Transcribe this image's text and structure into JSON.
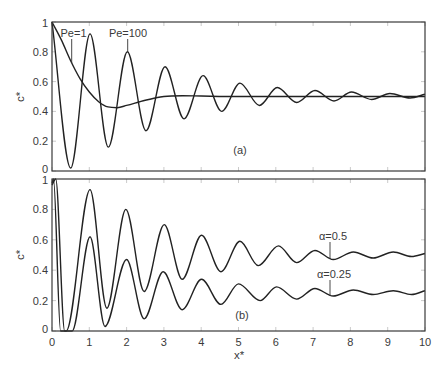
{
  "figure": {
    "x_axis_label": "x*",
    "panel_a": {
      "label": "(a)",
      "y_axis_label": "c*",
      "annotation_pe1": "Pe=1",
      "annotation_pe100": "Pe=100"
    },
    "panel_b": {
      "label": "(b)",
      "y_axis_label": "c*",
      "annotation_alpha05": "α=0.5",
      "annotation_alpha025": "α=0.25"
    },
    "colors": {
      "curve": "#222222",
      "axis": "#3a3a3a",
      "tick": "#bdbdbd"
    }
  },
  "chart_data": [
    {
      "type": "line",
      "panel": "(a)",
      "title": "",
      "xlabel": "",
      "ylabel": "c*",
      "xlim": [
        0,
        10
      ],
      "ylim": [
        0,
        1
      ],
      "xticks": [
        0,
        1,
        2,
        3,
        4,
        5,
        6,
        7,
        8,
        9,
        10
      ],
      "xtick_labels": [],
      "yticks": [
        0,
        0.2,
        0.4,
        0.6,
        0.8,
        1
      ],
      "ytick_labels": [
        "0",
        "0.2",
        "0.4",
        "0.6",
        "0.8",
        "1"
      ],
      "grid": false,
      "legend": "none (curves labelled by annotations)",
      "series": [
        {
          "name": "Pe=1",
          "x": [
            0,
            0.25,
            0.5,
            0.75,
            1.0,
            1.25,
            1.5,
            1.75,
            2.0,
            2.5,
            3.0,
            3.5,
            4.0,
            5.0,
            6.0,
            7.0,
            8.0,
            9.0,
            10.0
          ],
          "y": [
            1.0,
            0.88,
            0.74,
            0.62,
            0.53,
            0.465,
            0.43,
            0.425,
            0.44,
            0.475,
            0.5,
            0.505,
            0.503,
            0.5,
            0.5,
            0.5,
            0.5,
            0.5,
            0.5
          ]
        },
        {
          "name": "Pe=100",
          "x": [
            0,
            0.5,
            1.02,
            1.51,
            2.02,
            2.52,
            3.03,
            3.54,
            4.05,
            4.55,
            5.04,
            5.56,
            6.04,
            6.56,
            7.05,
            7.56,
            8.03,
            8.57,
            9.06,
            9.6,
            10.0
          ],
          "y": [
            1.0,
            0.02,
            0.92,
            0.16,
            0.8,
            0.27,
            0.7,
            0.35,
            0.64,
            0.4,
            0.59,
            0.44,
            0.56,
            0.46,
            0.54,
            0.47,
            0.53,
            0.48,
            0.52,
            0.49,
            0.515
          ]
        }
      ],
      "annotations": [
        {
          "text": "Pe=1",
          "points_to": [
            0.55,
            0.72
          ]
        },
        {
          "text": "Pe=100",
          "points_to": [
            2.02,
            0.8
          ]
        },
        {
          "text": "(a)",
          "position": [
            5.0,
            0.14
          ]
        }
      ]
    },
    {
      "type": "line",
      "panel": "(b)",
      "title": "",
      "xlabel": "x*",
      "ylabel": "c*",
      "xlim": [
        0,
        10
      ],
      "ylim": [
        0,
        1
      ],
      "xticks": [
        0,
        1,
        2,
        3,
        4,
        5,
        6,
        7,
        8,
        9,
        10
      ],
      "xtick_labels": [
        "0",
        "1",
        "2",
        "3",
        "4",
        "5",
        "6",
        "7",
        "8",
        "9",
        "10"
      ],
      "yticks": [
        0,
        0.2,
        0.4,
        0.6,
        0.8,
        1
      ],
      "ytick_labels": [
        "0",
        "0.2",
        "0.4",
        "0.6",
        "0.8",
        "1"
      ],
      "grid": false,
      "legend": "none (curves labelled by annotations)",
      "series": [
        {
          "name": "α=0.5",
          "x": [
            0,
            0.04,
            0.23,
            0.38,
            1.02,
            1.47,
            1.98,
            2.47,
            3.01,
            3.49,
            4.01,
            4.53,
            5.04,
            5.53,
            6.07,
            6.56,
            7.05,
            7.54,
            8.08,
            8.61,
            9.15,
            9.64,
            10.0
          ],
          "y": [
            0.97,
            1.0,
            0.0,
            0.0,
            0.93,
            0.15,
            0.8,
            0.26,
            0.7,
            0.34,
            0.63,
            0.39,
            0.59,
            0.43,
            0.56,
            0.45,
            0.53,
            0.47,
            0.52,
            0.48,
            0.52,
            0.49,
            0.51
          ]
        },
        {
          "name": "α=0.25",
          "x": [
            0,
            0.1,
            0.34,
            0.54,
            1.02,
            1.42,
            2.0,
            2.47,
            2.98,
            3.49,
            4.01,
            4.53,
            5.0,
            5.58,
            6.02,
            6.56,
            7.05,
            7.54,
            8.08,
            8.61,
            9.15,
            9.64,
            10.0
          ],
          "y": [
            0.96,
            1.0,
            0.0,
            0.0,
            0.62,
            0.03,
            0.47,
            0.08,
            0.39,
            0.14,
            0.34,
            0.175,
            0.31,
            0.2,
            0.29,
            0.21,
            0.28,
            0.23,
            0.27,
            0.24,
            0.265,
            0.24,
            0.265
          ]
        }
      ],
      "annotations": [
        {
          "text": "α=0.5",
          "points_to": [
            7.5,
            0.47
          ]
        },
        {
          "text": "α=0.25",
          "points_to": [
            7.5,
            0.23
          ]
        },
        {
          "text": "(b)",
          "position": [
            5.0,
            0.1
          ]
        }
      ]
    }
  ]
}
